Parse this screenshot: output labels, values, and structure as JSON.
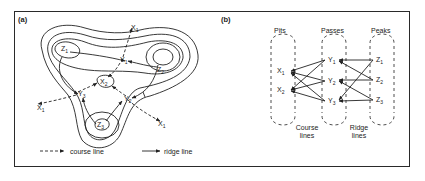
{
  "panel_a": {
    "label": "(a)",
    "nodes": {
      "z1": {
        "name": "Z",
        "sub": "1"
      },
      "z2": {
        "name": "Z",
        "sub": "2"
      },
      "z3": {
        "name": "Z",
        "sub": "3"
      },
      "y1": {
        "name": "Y",
        "sub": "1"
      },
      "y2": {
        "name": "Y",
        "sub": "2"
      },
      "y3": {
        "name": "Y",
        "sub": "3"
      },
      "x2": {
        "name": "X",
        "sub": "2"
      },
      "x1_top": {
        "name": "X",
        "sub": "1"
      },
      "x1_left": {
        "name": "X",
        "sub": "1"
      },
      "x1_right": {
        "name": "X",
        "sub": "1"
      }
    },
    "legend": {
      "course": "course line",
      "ridge": "ridge line"
    }
  },
  "panel_b": {
    "label": "(b)",
    "columns": {
      "pits": "Pits",
      "passes": "Passes",
      "peaks": "Peaks"
    },
    "pits": [
      {
        "name": "X",
        "sub": "1"
      },
      {
        "name": "X",
        "sub": "2"
      }
    ],
    "passes": [
      {
        "name": "Y",
        "sub": "1"
      },
      {
        "name": "Y",
        "sub": "2"
      },
      {
        "name": "Y",
        "sub": "3"
      }
    ],
    "peaks": [
      {
        "name": "Z",
        "sub": "1"
      },
      {
        "name": "Z",
        "sub": "2"
      },
      {
        "name": "Z",
        "sub": "3"
      }
    ],
    "captions": {
      "course_1": "Course",
      "course_2": "lines",
      "ridge_1": "Ridge",
      "ridge_2": "lines"
    }
  },
  "colors": {
    "ink": "#222222",
    "background": "#ffffff"
  }
}
